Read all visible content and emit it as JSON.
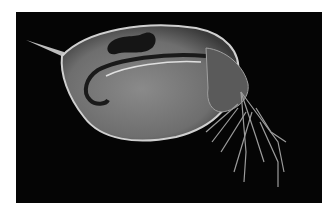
{
  "image": {
    "subject": "daphnia",
    "description": "Microscope photograph of a water flea (Daphnia) on a black background",
    "colors": {
      "background": "#050505",
      "border": "#ffffff",
      "body": "#9a9a9a",
      "highlight": "#d8d8d8",
      "dark_spot": "#151515"
    }
  }
}
